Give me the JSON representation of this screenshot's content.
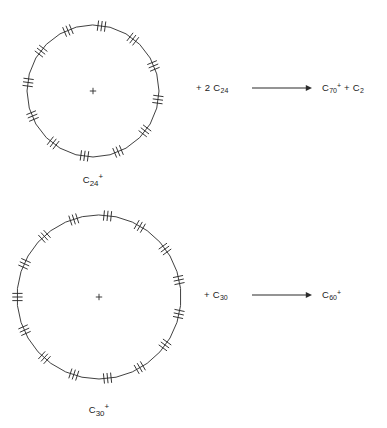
{
  "diagram": {
    "type": "reaction-scheme",
    "background_color": "#ffffff",
    "stroke_color": "#2b2b2b"
  },
  "reactions": [
    {
      "id": "reaction-1",
      "structure": {
        "name": "C24-ring-cation",
        "caption_html": "C<sub>24</sub><sup>+</sup>",
        "carbon_count": 24,
        "triple_bond_count": 12,
        "charge": "+",
        "charge_symbol": "+",
        "center_x": 93,
        "center_y": 91,
        "radius": 66
      },
      "reactant_html": "+ 2 C<sub>24</sub>",
      "arrow": {
        "name": "reaction-arrow",
        "direction": "right",
        "x1": 252,
        "x2": 312,
        "y": 88
      },
      "product_html": "C<sub>70</sub><sup>+</sup> + C<sub>2</sub>"
    },
    {
      "id": "reaction-2",
      "structure": {
        "name": "C30-ring-cation",
        "caption_html": "C<sub>30</sub><sup>+</sup>",
        "carbon_count": 30,
        "triple_bond_count": 15,
        "charge": "+",
        "charge_symbol": "+",
        "center_x": 99,
        "center_y": 297,
        "radius": 82
      },
      "reactant_html": "+ C<sub>30</sub>",
      "arrow": {
        "name": "reaction-arrow",
        "direction": "right",
        "x1": 252,
        "x2": 312,
        "y": 295
      },
      "product_html": "C<sub>60</sub><sup>+</sup>"
    }
  ],
  "labels": {
    "reaction_1_reactant_x": 196,
    "reaction_1_reactant_y": 82,
    "reaction_1_product_x": 322,
    "reaction_1_product_y": 82,
    "reaction_1_caption_x": 93,
    "reaction_1_caption_y": 172,
    "reaction_2_reactant_x": 204,
    "reaction_2_reactant_y": 289,
    "reaction_2_product_x": 322,
    "reaction_2_product_y": 289,
    "reaction_2_caption_x": 99,
    "reaction_2_caption_y": 402
  }
}
